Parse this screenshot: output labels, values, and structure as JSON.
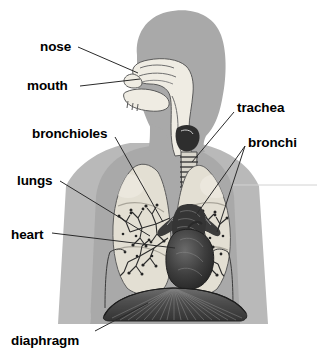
{
  "diagram": {
    "type": "labeled-anatomical-diagram",
    "background_color": "#ffffff",
    "body_silhouette_color": "#a8a8a8",
    "arm_silhouette_color": "#b8b8b8",
    "airway_color": "#efece4",
    "lung_color": "#e2ded2",
    "heart_color": "#3a3a3a",
    "diaphragm_color": "#4a4a4a",
    "leader_line_color": "#2a2a2a",
    "label_color": "#000000"
  },
  "labels": [
    {
      "id": "nose",
      "text": "nose",
      "x": 40,
      "y": 40,
      "leader": [
        [
          78,
          47
        ],
        [
          138,
          73
        ]
      ]
    },
    {
      "id": "mouth",
      "text": "mouth",
      "x": 27,
      "y": 79,
      "leader": [
        [
          80,
          86
        ],
        [
          140,
          79
        ]
      ]
    },
    {
      "id": "bronchioles",
      "text": "bronchioles",
      "x": 32,
      "y": 127,
      "leader": [
        [
          115,
          137
        ],
        [
          163,
          222
        ]
      ]
    },
    {
      "id": "lungs",
      "text": "lungs",
      "x": 17,
      "y": 174,
      "leader": [
        [
          60,
          181
        ],
        [
          150,
          236
        ]
      ]
    },
    {
      "id": "heart",
      "text": "heart",
      "x": 11,
      "y": 228,
      "leader": [
        [
          52,
          233
        ],
        [
          175,
          248
        ]
      ]
    },
    {
      "id": "trachea",
      "text": "trachea",
      "x": 237,
      "y": 101,
      "leader": [
        [
          234,
          112
        ],
        [
          192,
          162
        ]
      ]
    },
    {
      "id": "bronchi",
      "text": "bronchi",
      "x": 248,
      "y": 136,
      "leader_a": [
        [
          245,
          146
        ],
        [
          196,
          215
        ]
      ],
      "leader_b": [
        [
          245,
          146
        ],
        [
          217,
          232
        ]
      ]
    },
    {
      "id": "diaphragm",
      "text": "diaphragm",
      "x": 11,
      "y": 334,
      "leader": [
        [
          95,
          331
        ],
        [
          148,
          303
        ]
      ]
    }
  ]
}
